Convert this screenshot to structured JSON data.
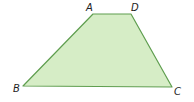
{
  "figure": {
    "shape": "trapezoid",
    "fill_color": "#d6edc6",
    "stroke_color": "#5f9e4f",
    "vertices": [
      {
        "name": "A",
        "label": "A"
      },
      {
        "name": "D",
        "label": "D"
      },
      {
        "name": "C",
        "label": "C"
      },
      {
        "name": "B",
        "label": "B"
      }
    ]
  }
}
